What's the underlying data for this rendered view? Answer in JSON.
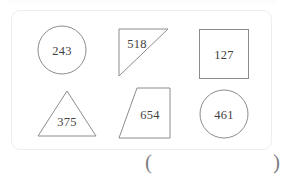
{
  "page": {
    "background_color": "#ffffff",
    "ink_color": "#3f3f42",
    "stroke_color": "#8c8c90",
    "panel_border_color": "#ededee"
  },
  "panel": {
    "name": "shapes-panel",
    "shapes": [
      {
        "id": "shape-1",
        "type": "circle",
        "label": "243",
        "row": 1,
        "column": 1
      },
      {
        "id": "shape-2",
        "type": "right-triangle",
        "label": "518",
        "row": 1,
        "column": 2
      },
      {
        "id": "shape-3",
        "type": "square",
        "label": "127",
        "row": 1,
        "column": 3
      },
      {
        "id": "shape-4",
        "type": "triangle",
        "label": "375",
        "row": 2,
        "column": 1
      },
      {
        "id": "shape-5",
        "type": "trapezoid",
        "label": "654",
        "row": 2,
        "column": 2
      },
      {
        "id": "shape-6",
        "type": "circle",
        "label": "461",
        "row": 2,
        "column": 3
      }
    ]
  },
  "answer": {
    "open_paren": "(",
    "close_paren": ")",
    "value": ""
  }
}
